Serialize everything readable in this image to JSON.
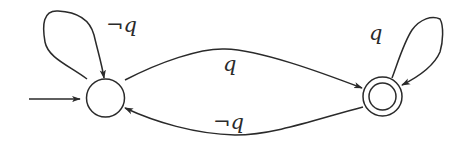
{
  "diagram": {
    "type": "finite-automaton",
    "states": [
      {
        "id": "s0",
        "initial": true,
        "accepting": false
      },
      {
        "id": "s1",
        "initial": false,
        "accepting": true
      }
    ],
    "transitions": [
      {
        "from": "s0",
        "to": "s0",
        "label": "¬q"
      },
      {
        "from": "s0",
        "to": "s1",
        "label": "q"
      },
      {
        "from": "s1",
        "to": "s1",
        "label": "q"
      },
      {
        "from": "s1",
        "to": "s0",
        "label": "¬q"
      }
    ],
    "labels": {
      "loop_s0": "¬q",
      "s0_to_s1": "q",
      "loop_s1": "q",
      "s1_to_s0": "¬q"
    },
    "colors": {
      "stroke": "#2a2a2a",
      "background": "#ffffff"
    }
  }
}
